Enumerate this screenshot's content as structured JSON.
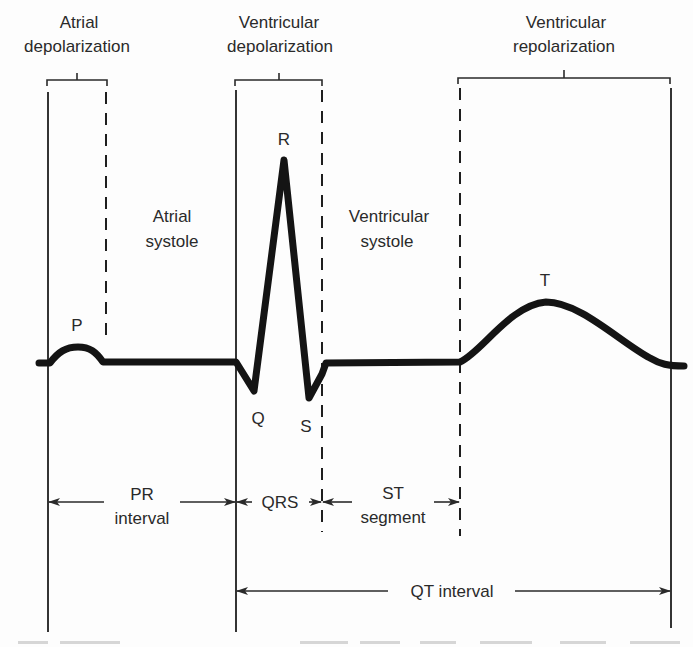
{
  "diagram": {
    "type": "ecg-waveform-annotated",
    "colors": {
      "ink": "#1a1a1a",
      "text": "#2a2a2a",
      "background": "#fdfdfd"
    },
    "top_labels": {
      "atrial_depolarization": {
        "line1": "Atrial",
        "line2": "depolarization"
      },
      "ventricular_depolarization": {
        "line1": "Ventricular",
        "line2": "depolarization"
      },
      "ventricular_repolarization": {
        "line1": "Ventricular",
        "line2": "repolarization"
      }
    },
    "phase_labels": {
      "atrial_systole": {
        "line1": "Atrial",
        "line2": "systole"
      },
      "ventricular_systole": {
        "line1": "Ventricular",
        "line2": "systole"
      }
    },
    "wave_labels": {
      "p": "P",
      "q": "Q",
      "r": "R",
      "s": "S",
      "t": "T"
    },
    "intervals": {
      "pr": {
        "line1": "PR",
        "line2": "interval"
      },
      "qrs": {
        "label": "QRS"
      },
      "st": {
        "line1": "ST",
        "line2": "segment"
      },
      "qt": {
        "label": "QT interval"
      }
    }
  }
}
